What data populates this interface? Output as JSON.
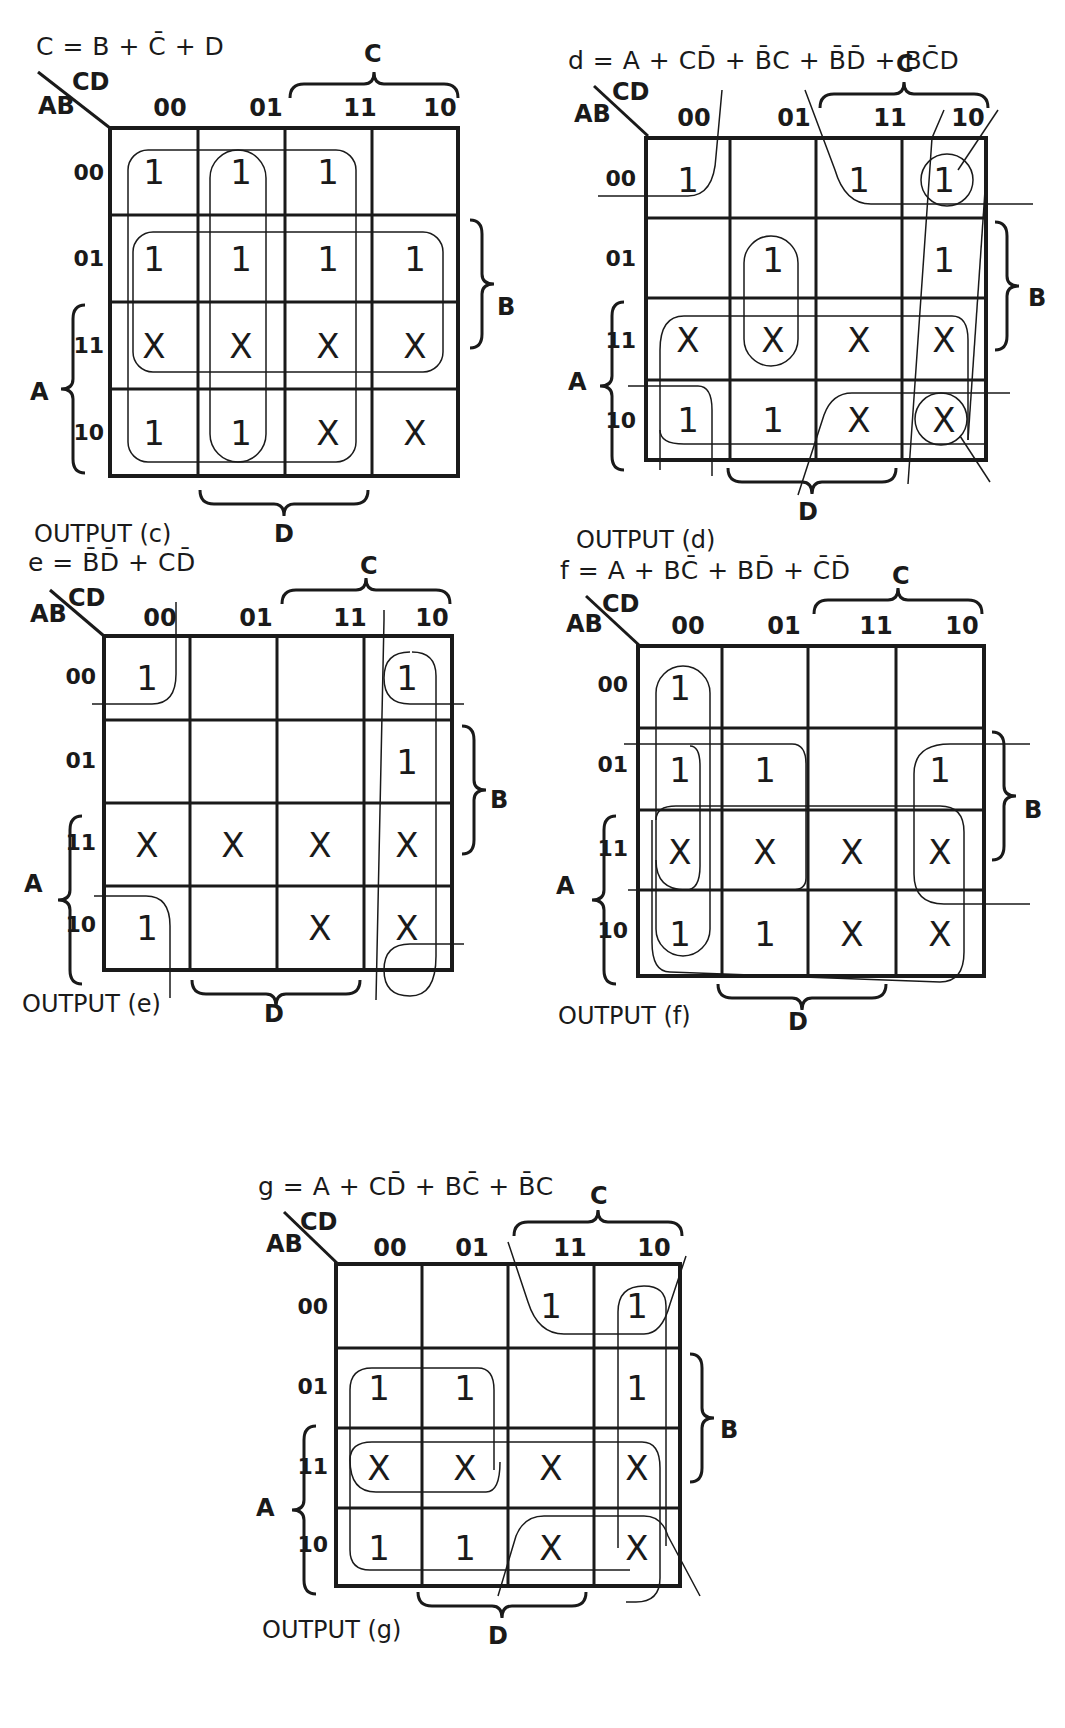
{
  "figure": {
    "axis_labels": {
      "row_var": "AB",
      "col_var": "CD",
      "col_group": "C",
      "row_group_b": "B",
      "row_group_a": "A",
      "col_group_d": "D"
    },
    "column_codes": [
      "00",
      "01",
      "11",
      "10"
    ],
    "row_codes": [
      "00",
      "01",
      "11",
      "10"
    ],
    "maps": [
      {
        "id": "c",
        "equation": "C = B + C̄ + D",
        "output_label": "OUTPUT (c)",
        "cells": [
          [
            "1",
            "1",
            "1",
            ""
          ],
          [
            "1",
            "1",
            "1",
            "1"
          ],
          [
            "X",
            "X",
            "X",
            "X"
          ],
          [
            "1",
            "1",
            "X",
            "X"
          ]
        ]
      },
      {
        "id": "d",
        "equation": "d = A + CD̄ + B̄C + B̄D̄ + BC̄D",
        "output_label": "OUTPUT (d)",
        "cells": [
          [
            "1",
            "",
            "1",
            "1"
          ],
          [
            "",
            "1",
            "",
            "1"
          ],
          [
            "X",
            "X",
            "X",
            "X"
          ],
          [
            "1",
            "1",
            "X",
            "X"
          ]
        ]
      },
      {
        "id": "e",
        "equation": "e = B̄D̄ + CD̄",
        "output_label": "OUTPUT (e)",
        "cells": [
          [
            "1",
            "",
            "",
            "1"
          ],
          [
            "",
            "",
            "",
            "1"
          ],
          [
            "X",
            "X",
            "X",
            "X"
          ],
          [
            "1",
            "",
            "X",
            "X"
          ]
        ]
      },
      {
        "id": "f",
        "equation": "f = A + BC̄ + BD̄ + C̄D̄",
        "output_label": "OUTPUT (f)",
        "cells": [
          [
            "1",
            "",
            "",
            ""
          ],
          [
            "1",
            "1",
            "",
            "1"
          ],
          [
            "X",
            "X",
            "X",
            "X"
          ],
          [
            "1",
            "1",
            "X",
            "X"
          ]
        ]
      },
      {
        "id": "g",
        "equation": "g = A + CD̄ + BC̄ + B̄C",
        "output_label": "OUTPUT (g)",
        "cells": [
          [
            "",
            "",
            "1",
            "1"
          ],
          [
            "1",
            "1",
            "",
            "1"
          ],
          [
            "X",
            "X",
            "X",
            "X"
          ],
          [
            "1",
            "1",
            "X",
            "X"
          ]
        ]
      }
    ]
  },
  "colors": {
    "ink": "#1a1a1a",
    "background": "#ffffff"
  }
}
